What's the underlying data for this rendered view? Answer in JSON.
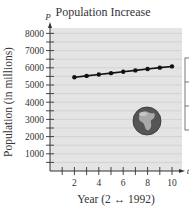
{
  "chart_data": {
    "type": "line",
    "title": "Population Increase",
    "xlabel": "Year (2 ↔ 1992)",
    "ylabel": "Population (in millions)",
    "x_var": "t",
    "y_var": "P",
    "x": [
      2,
      3,
      4,
      5,
      6,
      7,
      8,
      9,
      10
    ],
    "series": [
      {
        "name": "Population",
        "values": [
          5450,
          5530,
          5610,
          5690,
          5770,
          5850,
          5930,
          6010,
          6080
        ]
      }
    ],
    "xlim": [
      0,
      10.5
    ],
    "ylim": [
      0,
      8500
    ],
    "x_ticks": [
      1,
      2,
      3,
      4,
      5,
      6,
      7,
      8,
      9,
      10
    ],
    "x_tick_labels": [
      "2",
      "4",
      "6",
      "8",
      "10"
    ],
    "x_tick_label_values": [
      2,
      4,
      6,
      8,
      10
    ],
    "y_ticks": [
      500,
      1000,
      1500,
      2000,
      2500,
      3000,
      3500,
      4000,
      4500,
      5000,
      5500,
      6000,
      6500,
      7000,
      7500,
      8000
    ],
    "y_tick_labels": [
      "1000",
      "2000",
      "3000",
      "4000",
      "5000",
      "6000",
      "7000",
      "8000"
    ],
    "y_tick_label_values": [
      1000,
      2000,
      3000,
      4000,
      5000,
      6000,
      7000,
      8000
    ],
    "grid": true,
    "legend": "none",
    "annotations": [
      "globe image"
    ]
  },
  "colors": {
    "plot_bg": "#e4e4e4",
    "grid": "#c8c8c8",
    "line": "#111111",
    "axis": "#333333"
  }
}
